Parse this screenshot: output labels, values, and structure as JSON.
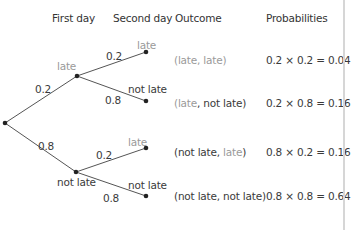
{
  "headers": {
    "first_day": "First day",
    "second_day": "Second day",
    "outcome": "Outcome",
    "probabilities": "Probabilities"
  },
  "tree": {
    "first_day_branches": [
      {
        "label": "late",
        "prob": "0.2"
      },
      {
        "label": "not late",
        "prob": "0.8"
      }
    ],
    "second_day_branches": [
      {
        "label": "late",
        "prob": "0.2"
      },
      {
        "label": "not late",
        "prob": "0.8"
      },
      {
        "label": "late",
        "prob": "0.2"
      },
      {
        "label": "not late",
        "prob": "0.8"
      }
    ]
  },
  "outcomes": [
    {
      "open": "(",
      "first": "late",
      "sep": ", ",
      "second": "late",
      "close": ")",
      "probability": "0.2 × 0.2 = 0.04"
    },
    {
      "open": "(",
      "first": "late",
      "sep": ", ",
      "second": "not late",
      "close": ")",
      "probability": "0.2 × 0.8 = 0.16"
    },
    {
      "open": "(",
      "first": "not late",
      "sep": ", ",
      "second": "late",
      "close": ")",
      "probability": "0.8 × 0.2 = 0.16"
    },
    {
      "open": "(",
      "first": "not late",
      "sep": ", ",
      "second": "not late",
      "close": ")",
      "probability": "0.8 × 0.8 = 0.64"
    }
  ],
  "colors": {
    "line": "#555555",
    "node": "#222222",
    "late_text": "#9a9a9a",
    "not_late_text": "#3a3a3a"
  }
}
